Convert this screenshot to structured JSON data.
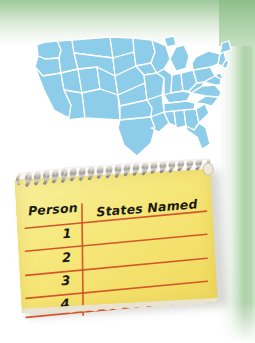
{
  "illustration": {
    "title": "states-named-activity",
    "background_color": "#ffffff",
    "frame_color": "#9ec99a"
  },
  "map": {
    "name": "united-states-map",
    "region_label": "United States",
    "fill_color": "#8ecdea",
    "border_color": "#ffffff"
  },
  "notepad": {
    "name": "spiral-notepad",
    "paper_color": "#f5e87a",
    "rule_color": "#d4562a",
    "binding": "spiral-wire",
    "table": {
      "columns": [
        "Person",
        "States Named"
      ],
      "rows": [
        {
          "person": "1",
          "states_named": ""
        },
        {
          "person": "2",
          "states_named": ""
        },
        {
          "person": "3",
          "states_named": ""
        },
        {
          "person": "4",
          "states_named": ""
        }
      ]
    }
  }
}
